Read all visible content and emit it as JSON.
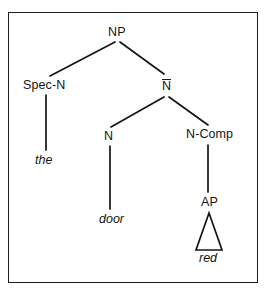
{
  "figure": {
    "kind": "x-bar-syntax-tree",
    "phrase": "the red door",
    "border_color": "#1c1c1c",
    "line_color": "#141414",
    "background": "#ffffff"
  },
  "tree": {
    "nodes": [
      {
        "id": "np",
        "label": "NP",
        "overline": false,
        "x": 117,
        "y": 33
      },
      {
        "id": "spec-n",
        "label": "Spec-N",
        "overline": false,
        "x": 46,
        "y": 86
      },
      {
        "id": "n-bar",
        "label": "N",
        "overline": true,
        "x": 166,
        "y": 86
      },
      {
        "id": "n",
        "label": "N",
        "overline": false,
        "x": 110,
        "y": 137
      },
      {
        "id": "n-comp",
        "label": "N-Comp",
        "overline": false,
        "x": 208,
        "y": 135
      },
      {
        "id": "ap",
        "label": "AP",
        "overline": false,
        "x": 209,
        "y": 203
      }
    ],
    "leaves": [
      {
        "id": "the",
        "label": "the",
        "x": 46,
        "y": 160
      },
      {
        "id": "door",
        "label": "door",
        "x": 116,
        "y": 219
      },
      {
        "id": "red",
        "label": "red",
        "x": 209,
        "y": 258
      }
    ],
    "edges": [
      {
        "from": "np",
        "to": "spec-n",
        "type": "branch"
      },
      {
        "from": "np",
        "to": "n-bar",
        "type": "branch"
      },
      {
        "from": "n-bar",
        "to": "n",
        "type": "branch"
      },
      {
        "from": "n-bar",
        "to": "n-comp",
        "type": "branch"
      },
      {
        "from": "spec-n",
        "to": "the",
        "type": "stem"
      },
      {
        "from": "n",
        "to": "door",
        "type": "stem"
      },
      {
        "from": "n-comp",
        "to": "ap",
        "type": "stem"
      },
      {
        "from": "ap",
        "to": "red",
        "type": "triangle"
      }
    ],
    "triangle": {
      "apex_x": 209,
      "apex_y": 213,
      "base_left_x": 196,
      "base_right_x": 222,
      "base_y": 250
    }
  }
}
